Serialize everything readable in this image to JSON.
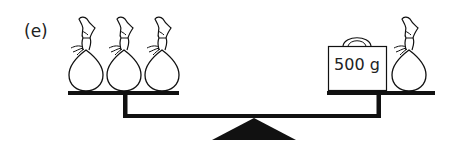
{
  "figure": {
    "label": "(e)",
    "left_pan": {
      "items": [
        {
          "type": "bag",
          "name": "bag-1"
        },
        {
          "type": "bag",
          "name": "bag-2"
        },
        {
          "type": "bag",
          "name": "bag-3"
        }
      ]
    },
    "right_pan": {
      "items": [
        {
          "type": "weight",
          "label": "500 g"
        },
        {
          "type": "bag",
          "name": "bag-4"
        }
      ]
    },
    "balance_state": "level",
    "colors": {
      "ink": "#111111",
      "background": "#ffffff"
    }
  }
}
